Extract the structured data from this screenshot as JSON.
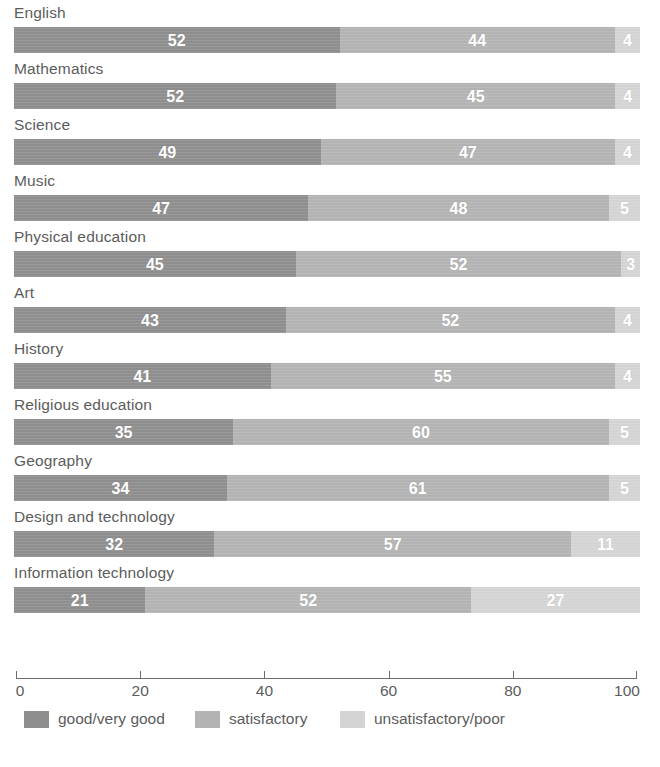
{
  "chart_data": {
    "type": "bar",
    "subtype": "stacked-horizontal-100",
    "title": "",
    "xlabel": "",
    "ylabel": "",
    "xlim": [
      0,
      100
    ],
    "grid": false,
    "legend_position": "bottom",
    "categories": [
      "English",
      "Mathematics",
      "Science",
      "Music",
      "Physical education",
      "Art",
      "History",
      "Religious education",
      "Geography",
      "Design and technology",
      "Information technology"
    ],
    "series": [
      {
        "name": "good/very good",
        "color": "#8e8e8e",
        "values": [
          52,
          52,
          49,
          47,
          45,
          43,
          41,
          35,
          34,
          32,
          21
        ]
      },
      {
        "name": "satisfactory",
        "color": "#b3b3b3",
        "values": [
          44,
          45,
          47,
          48,
          52,
          52,
          55,
          60,
          61,
          57,
          52
        ]
      },
      {
        "name": "unsatisfactory/poor",
        "color": "#d4d4d4",
        "values": [
          4,
          4,
          4,
          5,
          3,
          4,
          4,
          5,
          5,
          11,
          27
        ]
      }
    ],
    "axis": {
      "ticks": [
        0,
        20,
        40,
        60,
        80,
        100
      ],
      "tick_labels": [
        "0",
        "20",
        "40",
        "60",
        "80",
        "100"
      ]
    }
  },
  "legend": {
    "items": [
      {
        "label": "good/very good",
        "color": "#8e8e8e",
        "left": 24
      },
      {
        "label": "satisfactory",
        "color": "#b3b3b3",
        "left": 195
      },
      {
        "label": "unsatisfactory/poor",
        "color": "#d4d4d4",
        "left": 340
      }
    ]
  },
  "caption": ""
}
